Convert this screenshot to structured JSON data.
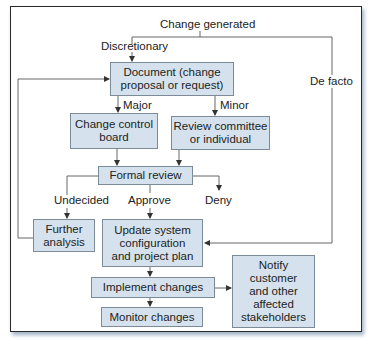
{
  "diagram": {
    "type": "flowchart",
    "colors": {
      "box_fill": "#d5e2ee",
      "box_border": "#7d8a97",
      "line": "#555555"
    },
    "start_label": "Change generated",
    "edge_labels": {
      "discretionary": "Discretionary",
      "de_facto": "De facto",
      "major": "Major",
      "minor": "Minor",
      "undecided": "Undecided",
      "approve": "Approve",
      "deny": "Deny"
    },
    "nodes": {
      "document": "Document (change\nproposal or request)",
      "change_control_board": "Change control\nboard",
      "review_committee": "Review committee\nor individual",
      "formal_review": "Formal review",
      "further_analysis": "Further\nanalysis",
      "update_system": "Update system\nconfiguration\nand project plan",
      "implement_changes": "Implement changes",
      "monitor_changes": "Monitor changes",
      "notify": "Notify\ncustomer\nand other\naffected\nstakeholders"
    },
    "edges": [
      {
        "from": "Change generated",
        "to": "document",
        "label": "Discretionary"
      },
      {
        "from": "Change generated",
        "to": "update_system",
        "label": "De facto"
      },
      {
        "from": "document",
        "to": "change_control_board",
        "label": "Major"
      },
      {
        "from": "document",
        "to": "review_committee",
        "label": "Minor"
      },
      {
        "from": "change_control_board",
        "to": "formal_review"
      },
      {
        "from": "review_committee",
        "to": "formal_review"
      },
      {
        "from": "formal_review",
        "to": "further_analysis",
        "label": "Undecided"
      },
      {
        "from": "formal_review",
        "to": "update_system",
        "label": "Approve"
      },
      {
        "from": "formal_review",
        "to": "end",
        "label": "Deny"
      },
      {
        "from": "further_analysis",
        "to": "document"
      },
      {
        "from": "update_system",
        "to": "implement_changes"
      },
      {
        "from": "implement_changes",
        "to": "monitor_changes"
      },
      {
        "from": "implement_changes",
        "to": "notify"
      }
    ]
  }
}
